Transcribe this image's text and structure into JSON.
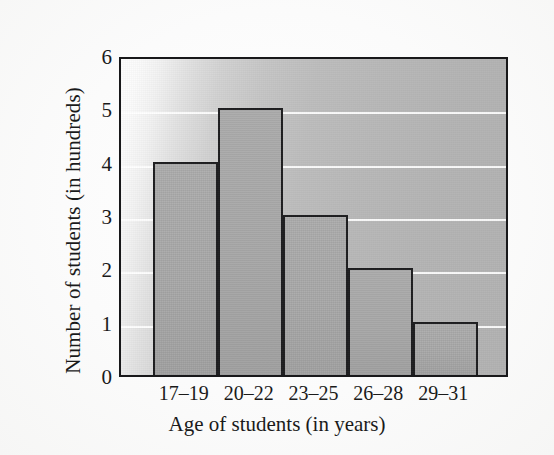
{
  "chart_data": {
    "type": "bar",
    "title": "",
    "subtitle": "",
    "xlabel": "Age of students (in years)",
    "ylabel": "Number of students (in hundreds)",
    "categories": [
      "17–19",
      "20–22",
      "23–25",
      "26–28",
      "29–31"
    ],
    "values": [
      4,
      5,
      3,
      2,
      1
    ],
    "series": [
      {
        "name": "Number of students (in hundreds)",
        "values": [
          4,
          5,
          3,
          2,
          1
        ]
      }
    ],
    "ylim": [
      0,
      6
    ],
    "xlim": [
      0,
      6
    ],
    "yticks": [
      0,
      1,
      2,
      3,
      4,
      5,
      6
    ],
    "ytick_labels": [
      "0",
      "1",
      "2",
      "3",
      "4",
      "5",
      "6"
    ],
    "grid": "horizontal-only",
    "gridline_color": "#ffffff",
    "legend": "none",
    "legend_position": "none",
    "annotations": [],
    "bar_count": 5,
    "bar_fill_color": "#a9a9a9",
    "bar_edge_color": "#1d1d1f",
    "panel_background": "gradient-light-to-gray",
    "panel_border_color": "#18181a",
    "page_background": "#fcfcfc"
  },
  "axes": {
    "y_title": "Number of students (in hundreds)",
    "x_title": "Age of students (in years)"
  }
}
